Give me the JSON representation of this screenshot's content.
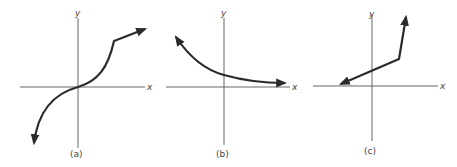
{
  "figure": {
    "panels": [
      {
        "id": "a",
        "caption": "(a)",
        "x_axis_label": "x",
        "y_axis_label": "y",
        "description": "S-shaped increasing curve through the origin with a kink, then a shallower straight segment; arrows at both ends"
      },
      {
        "id": "b",
        "caption": "(b)",
        "x_axis_label": "x",
        "y_axis_label": "y",
        "description": "Decreasing convex curve approaching the x-axis from above; arrows at both ends"
      },
      {
        "id": "c",
        "caption": "(c)",
        "x_axis_label": "x",
        "y_axis_label": "y",
        "description": "Piecewise linear: shallow increasing line with positive y-intercept, then a steep increasing segment; arrows at both ends"
      }
    ],
    "colors": {
      "curve": "#2a2a2a",
      "axis": "#555555",
      "text": "#444444",
      "background": "#ffffff"
    }
  }
}
